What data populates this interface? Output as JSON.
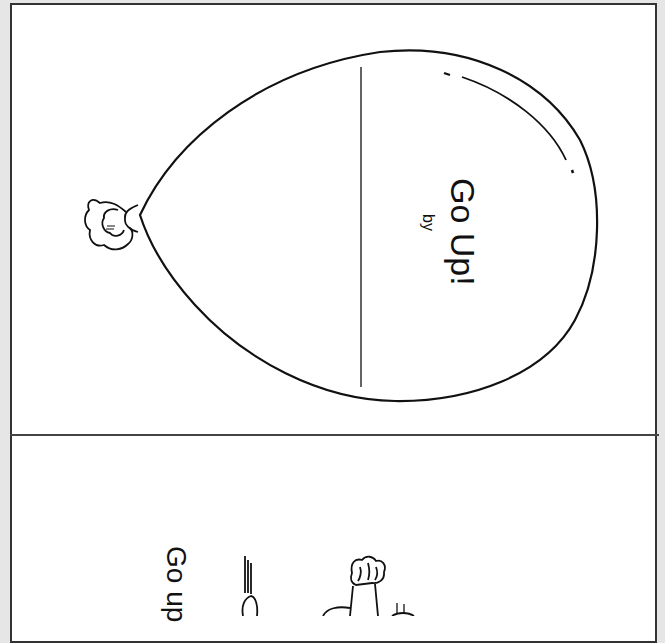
{
  "cover": {
    "title": "Go Up!",
    "byline": "by",
    "illustration": "balloon-with-knot",
    "name_line": "blank author line"
  },
  "page_2": {
    "caption": "Go up",
    "illustration": "raised-hands-cartoon"
  },
  "colors": {
    "background": "#e6e6e6",
    "page": "#ffffff",
    "ink": "#111111"
  }
}
